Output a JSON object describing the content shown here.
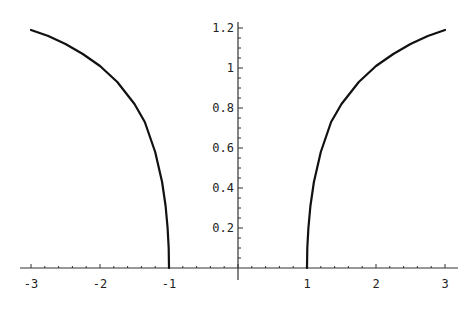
{
  "chart_data": {
    "type": "line",
    "title": "",
    "xlabel": "",
    "ylabel": "",
    "xlim": [
      -3,
      3
    ],
    "ylim": [
      0,
      1.2
    ],
    "grid": false,
    "legend": null,
    "x_ticks": [
      "-3",
      "-2",
      "-1",
      "1",
      "2",
      "3"
    ],
    "x_tick_values": [
      -3,
      -2,
      -1,
      1,
      2,
      3
    ],
    "y_ticks": [
      "0.2",
      "0.4",
      "0.6",
      "0.8",
      "1",
      "1.2"
    ],
    "y_tick_values": [
      0.2,
      0.4,
      0.6,
      0.8,
      1,
      1.2
    ],
    "series": [
      {
        "name": "left branch",
        "x": [
          -3,
          -2.75,
          -2.5,
          -2.25,
          -2,
          -1.75,
          -1.5,
          -1.35,
          -1.2,
          -1.1,
          -1.05,
          -1.02,
          -1.005,
          -1
        ],
        "y": [
          1.19,
          1.16,
          1.12,
          1.07,
          1.01,
          0.93,
          0.82,
          0.73,
          0.58,
          0.43,
          0.31,
          0.2,
          0.1,
          0
        ]
      },
      {
        "name": "right branch",
        "x": [
          1,
          1.005,
          1.02,
          1.05,
          1.1,
          1.2,
          1.35,
          1.5,
          1.75,
          2,
          2.25,
          2.5,
          2.75,
          3
        ],
        "y": [
          0,
          0.1,
          0.2,
          0.31,
          0.43,
          0.58,
          0.73,
          0.82,
          0.93,
          1.01,
          1.07,
          1.12,
          1.16,
          1.19
        ]
      }
    ],
    "line_color": "#111111"
  }
}
